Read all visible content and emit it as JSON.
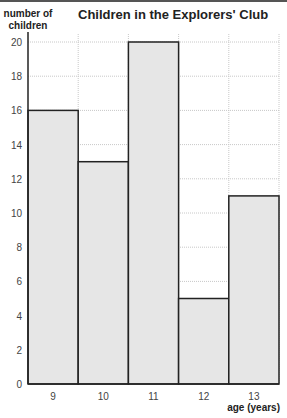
{
  "chart_data": {
    "type": "bar",
    "title": "Children in the Explorers' Club",
    "xlabel": "age (years)",
    "ylabel": "number of children",
    "categories": [
      "9",
      "10",
      "11",
      "12",
      "13"
    ],
    "values": [
      16,
      13,
      20,
      5,
      11
    ],
    "ylim": [
      0,
      20
    ],
    "yticks": [
      0,
      2,
      4,
      6,
      8,
      10,
      12,
      14,
      16,
      18,
      20
    ],
    "grid": true,
    "bar_color": "#e6e6e6",
    "edge_color": "#222222"
  },
  "title": "Children in the Explorers' Club",
  "ylabel_line1": "number of",
  "ylabel_line2": "children",
  "xlabel": "age (years)"
}
